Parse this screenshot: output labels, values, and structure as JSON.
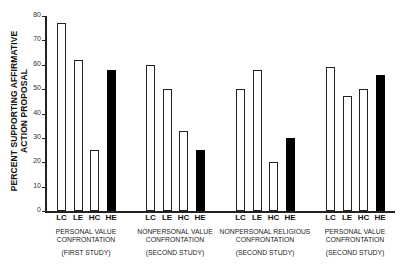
{
  "chart_data": {
    "type": "bar",
    "title": "",
    "ylabel": "PERCENT SUPPORTING AFFIRMATIVE ACTION PROPOSAL",
    "ylabel_lines": [
      "PERCENT SUPPORTING AFFIRMATIVE",
      "ACTION PROPOSAL"
    ],
    "xlabel": "",
    "ylim": [
      0,
      80
    ],
    "yticks": [
      0,
      10,
      20,
      30,
      40,
      50,
      60,
      70,
      80
    ],
    "grid": false,
    "categories": [
      "LC",
      "LE",
      "HC",
      "HE"
    ],
    "bar_styles": {
      "LC": "open",
      "LE": "open",
      "HC": "open",
      "HE": "filled"
    },
    "groups": [
      {
        "label_lines": [
          "PERSONAL VALUE",
          "CONFRONTATION"
        ],
        "study": "(FIRST STUDY)",
        "values": [
          77,
          62,
          25,
          58
        ]
      },
      {
        "label_lines": [
          "NONPERSONAL VALUE",
          "CONFRONTATION"
        ],
        "study": "(SECOND STUDY)",
        "values": [
          60,
          50,
          33,
          25
        ]
      },
      {
        "label_lines": [
          "NONPERSONAL RELIGIOUS",
          "CONFRONTATION"
        ],
        "study": "(SECOND STUDY)",
        "values": [
          50,
          58,
          20,
          30
        ]
      },
      {
        "label_lines": [
          "PERSONAL VALUE",
          "CONFRONTATION"
        ],
        "study": "(SECOND STUDY)",
        "values": [
          59,
          47,
          50,
          56
        ]
      }
    ]
  },
  "colors": {
    "open_fill": "#ffffff",
    "filled": "#000000",
    "axis": "#222222"
  }
}
